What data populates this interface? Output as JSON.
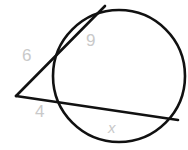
{
  "figure": {
    "kind": "circle-secant-geometry-diagram",
    "width": 188,
    "height": 150,
    "background_color": "#ffffff",
    "stroke_color": "#111111",
    "label_color": "#c9c9c9"
  },
  "circle": {
    "name": "main-circle",
    "center_x": 119,
    "center_y": 76,
    "radius": 66,
    "stroke_width": 2.6
  },
  "external_point": {
    "name": "external-vertex",
    "x": 16,
    "y": 96
  },
  "lines": [
    {
      "name": "upper-secant",
      "from_x": 16,
      "from_y": 96,
      "near_x": 57,
      "near_y": 58,
      "far_x": 105,
      "far_y": 6,
      "stroke_width": 2.6
    },
    {
      "name": "lower-secant",
      "from_x": 16,
      "from_y": 96,
      "near_x": 60,
      "near_y": 105,
      "far_x": 178,
      "far_y": 120,
      "stroke_width": 2.6
    }
  ],
  "labels": {
    "upper_external_segment": "6",
    "upper_chord_segment": "9",
    "lower_external_segment": "4",
    "lower_chord_segment": "x"
  }
}
